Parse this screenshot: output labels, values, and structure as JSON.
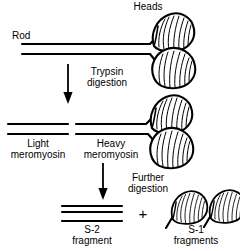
{
  "figure": {
    "background_color": "#ffffff",
    "line_color": "#000000",
    "text_color": "#000000"
  },
  "labels": {
    "heads": "Heads",
    "rod": "Rod",
    "trypsin_line1": "Trypsin",
    "trypsin_line2": "digestion",
    "light_line1": "Light",
    "light_line2": "meromyosin",
    "heavy_line1": "Heavy",
    "heavy_line2": "meromyosin",
    "further_line1": "Further",
    "further_line2": "digestion",
    "s2_line1": "S-2",
    "s2_line2": "fragment",
    "s1_line1": "S-1",
    "s1_line2": "fragments",
    "plus": "+"
  },
  "icons": {
    "arrow_trypsin": "down-arrow-icon",
    "arrow_further": "down-arrow-icon",
    "myosin_head": "myosin-head-icon",
    "rod_lines": "rod-filament-icon"
  }
}
